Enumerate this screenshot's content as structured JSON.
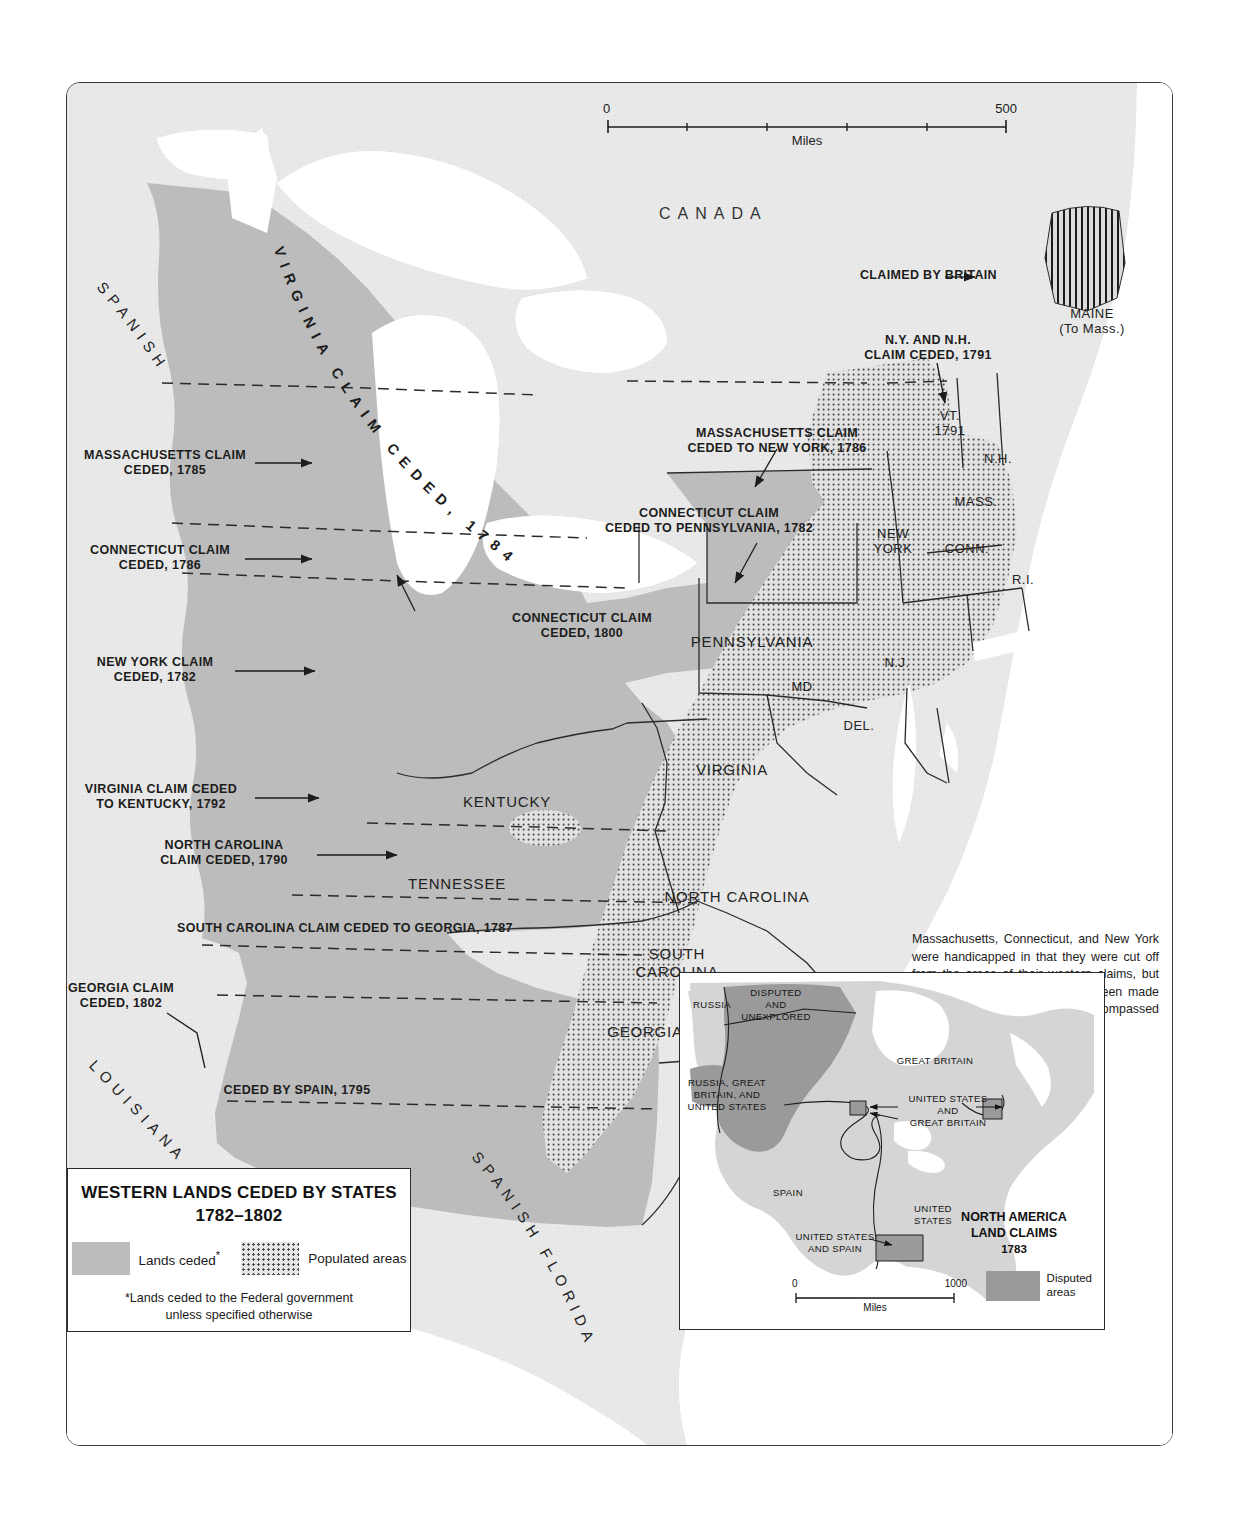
{
  "scale": {
    "left_label": "0",
    "right_label": "500",
    "units": "Miles"
  },
  "map_labels": {
    "canada": "CANADA",
    "spanish": "SPANISH",
    "louisiana": "LOUISIANA",
    "spanish_florida": "SPANISH FLORIDA",
    "virginia_claim_arc": "VIRGINIA CLAIM CEDED, 1784",
    "states": [
      {
        "name": "kentucky",
        "text": "KENTUCKY"
      },
      {
        "name": "tennessee",
        "text": "TENNESSEE"
      },
      {
        "name": "virginia",
        "text": "VIRGINIA"
      },
      {
        "name": "north-carolina",
        "text": "NORTH CAROLINA"
      },
      {
        "name": "south-carolina",
        "text": "SOUTH\nCAROLINA"
      },
      {
        "name": "georgia",
        "text": "GEORGIA"
      },
      {
        "name": "pennsylvania",
        "text": "PENNSYLVANIA"
      },
      {
        "name": "maryland",
        "text": "MD"
      },
      {
        "name": "delaware",
        "text": "DEL."
      },
      {
        "name": "new-jersey",
        "text": "N.J."
      },
      {
        "name": "new-york",
        "text": "NEW\nYORK"
      },
      {
        "name": "connecticut",
        "text": "CONN."
      },
      {
        "name": "rhode-island",
        "text": "R.I."
      },
      {
        "name": "massachusetts",
        "text": "MASS."
      },
      {
        "name": "new-hampshire",
        "text": "N.H."
      },
      {
        "name": "vermont",
        "text": "VT.\n1791"
      },
      {
        "name": "maine",
        "text": "MAINE\n(To Mass.)"
      }
    ]
  },
  "annotations": [
    {
      "name": "massachusetts-claim-ceded-1785",
      "text": "MASSACHUSETTS CLAIM\nCEDED, 1785"
    },
    {
      "name": "connecticut-claim-ceded-1786",
      "text": "CONNECTICUT CLAIM\nCEDED, 1786"
    },
    {
      "name": "new-york-claim-ceded-1782",
      "text": "NEW YORK CLAIM\nCEDED, 1782"
    },
    {
      "name": "virginia-claim-ceded-to-kentucky-1792",
      "text": "VIRGINIA CLAIM CEDED\nTO KENTUCKY, 1792"
    },
    {
      "name": "north-carolina-claim-ceded-1790",
      "text": "NORTH CAROLINA\nCLAIM CEDED, 1790"
    },
    {
      "name": "south-carolina-claim-ceded-to-georgia-1787",
      "text": "SOUTH CAROLINA CLAIM CEDED TO GEORGIA, 1787"
    },
    {
      "name": "georgia-claim-ceded-1802",
      "text": "GEORGIA CLAIM\nCEDED, 1802"
    },
    {
      "name": "ceded-by-spain-1795",
      "text": "CEDED BY SPAIN, 1795"
    },
    {
      "name": "massachusetts-claim-ceded-to-new-york-1786",
      "text": "MASSACHUSETTS CLAIM\nCEDED TO NEW YORK, 1786"
    },
    {
      "name": "connecticut-claim-ceded-to-pennsylvania-1782",
      "text": "CONNECTICUT CLAIM\nCEDED TO PENNSYLVANIA, 1782"
    },
    {
      "name": "connecticut-claim-ceded-1800",
      "text": "CONNECTICUT CLAIM\nCEDED, 1800"
    },
    {
      "name": "claimed-by-britain",
      "text": "CLAIMED BY BRITAIN"
    },
    {
      "name": "ny-and-nh-claim-ceded-1791",
      "text": "N.Y. AND N.H.\nCLAIM CEDED, 1791"
    }
  ],
  "note": "Massachusetts, Connecticut, and New York were handicapped in that they were cut off from the areas of their western claims, but Virginia was not. Had its claim been made good, Virginia would have encompassed eight present states.",
  "legend": {
    "title_line1": "WESTERN LANDS CEDED BY STATES",
    "title_line2": "1782–1802",
    "key_lands_ceded": "Lands ceded",
    "key_lands_ceded_marker": "*",
    "key_populated": "Populated areas",
    "footnote_line1": "*Lands ceded to the Federal government",
    "footnote_line2": "unless specified otherwise"
  },
  "inset": {
    "title_line1": "NORTH AMERICA",
    "title_line2": "LAND CLAIMS",
    "year": "1783",
    "key_label_line1": "Disputed",
    "key_label_line2": "areas",
    "scale": {
      "left_label": "0",
      "right_label": "1000",
      "units": "Miles"
    },
    "labels": [
      {
        "name": "russia",
        "text": "RUSSIA"
      },
      {
        "name": "disputed-and-unexplored",
        "text": "DISPUTED\nAND\nUNEXPLORED"
      },
      {
        "name": "russia-great-britain-and-united-states",
        "text": "RUSSIA, GREAT\nBRITAIN, AND\nUNITED STATES"
      },
      {
        "name": "great-britain",
        "text": "GREAT BRITAIN"
      },
      {
        "name": "united-states-and-great-britain",
        "text": "UNITED STATES\nAND\nGREAT BRITAIN"
      },
      {
        "name": "spain",
        "text": "SPAIN"
      },
      {
        "name": "united-states",
        "text": "UNITED\nSTATES"
      },
      {
        "name": "united-states-and-spain",
        "text": "UNITED STATES\nAND SPAIN"
      }
    ]
  },
  "colors": {
    "background": "#e8e8e8",
    "ceded_lands": "#bcbcbc",
    "water": "#ffffff",
    "populated_dots": "#4d4d4d",
    "disputed": "#9a9a9a",
    "border": "#2a2a2a"
  }
}
